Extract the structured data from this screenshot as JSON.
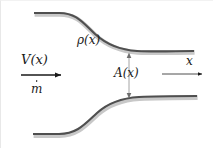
{
  "figure": {
    "background_color": "#ffffff",
    "wall_color": "#4a4a4a",
    "wall_highlight_color": "#cfcfcf",
    "arrow_color": "#1a1a1a",
    "dimension_arrow_color": "#8a8a8a"
  },
  "labels": {
    "velocity": "V(x)",
    "mass_flow": "m",
    "mass_flow_accent": "dot",
    "density": "ρ(x)",
    "area": "A(x)",
    "axis": "x"
  },
  "arrows": {
    "flow_arrow": {
      "name": "flow-direction-arrow",
      "direction": "right",
      "x1": 20,
      "y1": 74,
      "x2": 66,
      "y2": 74
    },
    "axis_arrow": {
      "name": "x-axis-arrow",
      "direction": "right",
      "x1": 160,
      "y1": 73,
      "x2": 206,
      "y2": 73
    },
    "area_arrow": {
      "name": "area-dimension-arrow",
      "direction": "both",
      "x1": 128,
      "y1": 52,
      "x2": 128,
      "y2": 97
    }
  },
  "walls": {
    "upper": {
      "name": "upper-duct-wall",
      "path": "M 33 12 L 58 12 C 76 12 82 22 94 33 C 106 44 120 49 136 50 C 155 51 175 50 193 50"
    },
    "lower": {
      "name": "lower-duct-wall",
      "path": "M 32 133 L 58 133 C 76 133 84 123 96 112 C 108 101 122 97 138 96 C 157 95 178 95 196 95"
    }
  },
  "chart_data": {
    "type": "diagram",
    "annotations": [
      "V(x)",
      "ṁ",
      "ρ(x)",
      "A(x)",
      "x"
    ]
  }
}
